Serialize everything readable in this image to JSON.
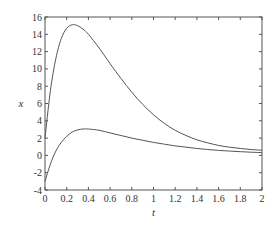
{
  "chart_data": {
    "type": "line",
    "title": "",
    "xlabel": "t",
    "ylabel": "x",
    "xlim": [
      0,
      2
    ],
    "ylim": [
      -4,
      16
    ],
    "grid": false,
    "legend": null,
    "xticks": [
      "0",
      "0.2",
      "0.4",
      "0.6",
      "0.8",
      "1",
      "1.2",
      "1.4",
      "1.6",
      "1.8",
      "2"
    ],
    "yticks": [
      "-4",
      "-2",
      "0",
      "2",
      "4",
      "6",
      "8",
      "10",
      "12",
      "14",
      "16"
    ],
    "series": [
      {
        "name": "upper",
        "color": "#555555",
        "x": [
          0,
          0.05,
          0.1,
          0.15,
          0.2,
          0.25,
          0.3,
          0.35,
          0.4,
          0.5,
          0.6,
          0.7,
          0.8,
          0.9,
          1.0,
          1.1,
          1.2,
          1.3,
          1.4,
          1.5,
          1.6,
          1.7,
          1.8,
          1.9,
          2.0
        ],
        "y": [
          2.0,
          7.5,
          11.2,
          13.5,
          14.7,
          15.1,
          15.0,
          14.6,
          14.0,
          12.4,
          10.6,
          8.9,
          7.3,
          5.9,
          4.7,
          3.7,
          2.9,
          2.3,
          1.8,
          1.45,
          1.15,
          0.95,
          0.8,
          0.68,
          0.6
        ]
      },
      {
        "name": "lower",
        "color": "#555555",
        "x": [
          0,
          0.05,
          0.1,
          0.15,
          0.2,
          0.25,
          0.3,
          0.35,
          0.4,
          0.5,
          0.6,
          0.7,
          0.8,
          0.9,
          1.0,
          1.1,
          1.2,
          1.3,
          1.4,
          1.5,
          1.6,
          1.7,
          1.8,
          1.9,
          2.0
        ],
        "y": [
          -3.0,
          -1.0,
          0.5,
          1.5,
          2.2,
          2.7,
          2.95,
          3.05,
          3.05,
          2.9,
          2.6,
          2.3,
          2.0,
          1.75,
          1.5,
          1.3,
          1.1,
          0.95,
          0.8,
          0.68,
          0.58,
          0.5,
          0.43,
          0.37,
          0.32
        ]
      }
    ]
  }
}
